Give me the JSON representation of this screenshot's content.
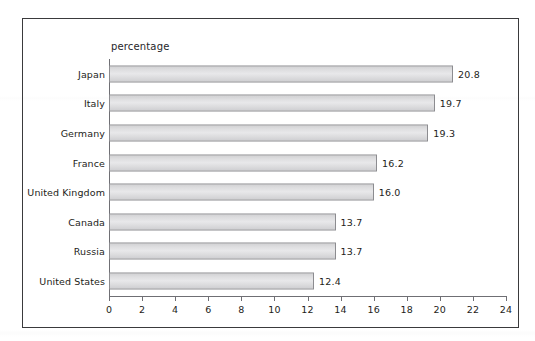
{
  "chart_data": {
    "type": "bar",
    "orientation": "horizontal",
    "title": "",
    "subtitle": "",
    "xlabel": "percentage",
    "ylabel": "",
    "xlim": [
      0,
      24
    ],
    "ylim": null,
    "grid": false,
    "legend": null,
    "categories": [
      "Japan",
      "Italy",
      "Germany",
      "France",
      "United Kingdom",
      "Canada",
      "Russia",
      "United States"
    ],
    "values": [
      20.8,
      19.7,
      19.3,
      16.2,
      16.0,
      13.7,
      13.7,
      12.4
    ],
    "value_labels": [
      "20.8",
      "19.7",
      "19.3",
      "16.2",
      "16.0",
      "13.7",
      "13.7",
      "12.4"
    ],
    "x_ticks": [
      0,
      2,
      4,
      6,
      8,
      10,
      12,
      14,
      16,
      18,
      20,
      22,
      24
    ],
    "x_tick_labels": [
      "0",
      "2",
      "4",
      "6",
      "8",
      "10",
      "12",
      "14",
      "16",
      "18",
      "20",
      "22",
      "24"
    ],
    "bar_fill_color": "#dedee0",
    "bar_border_color": "#8c8c90",
    "axis_color": "#6f6f74",
    "text_color": "#1d1d20",
    "frame_border_color": "#3a3a3c",
    "background_color": "#ffffff"
  },
  "axis": {
    "percentage_label": "percentage"
  }
}
